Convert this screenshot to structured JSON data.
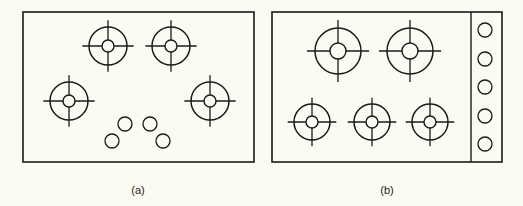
{
  "diagram": {
    "stroke_color": "#1a1a1a",
    "background": "#fbfaf3",
    "panels": [
      {
        "id": "a",
        "caption": "(a)",
        "frame": {
          "x": 23,
          "y": 12,
          "w": 231,
          "h": 150
        },
        "burners": [
          {
            "cx": 108,
            "cy": 46,
            "r": 19,
            "ri": 6
          },
          {
            "cx": 171,
            "cy": 46,
            "r": 19,
            "ri": 6
          },
          {
            "cx": 69,
            "cy": 101,
            "r": 19,
            "ri": 6
          },
          {
            "cx": 210,
            "cy": 101,
            "r": 19,
            "ri": 6
          }
        ],
        "knobs": [
          {
            "cx": 125,
            "cy": 124,
            "r": 7
          },
          {
            "cx": 150,
            "cy": 124,
            "r": 7
          },
          {
            "cx": 112,
            "cy": 141,
            "r": 7
          },
          {
            "cx": 163,
            "cy": 141,
            "r": 7
          }
        ]
      },
      {
        "id": "b",
        "caption": "(b)",
        "frame": {
          "x": 272,
          "y": 12,
          "w": 230,
          "h": 150
        },
        "divider_x": 471,
        "burners": [
          {
            "cx": 338,
            "cy": 51,
            "r": 23,
            "ri": 8
          },
          {
            "cx": 410,
            "cy": 51,
            "r": 23,
            "ri": 8
          },
          {
            "cx": 312,
            "cy": 122,
            "r": 18,
            "ri": 6
          },
          {
            "cx": 372,
            "cy": 122,
            "r": 18,
            "ri": 6
          },
          {
            "cx": 430,
            "cy": 122,
            "r": 18,
            "ri": 6
          }
        ],
        "knobs": [
          {
            "cx": 485,
            "cy": 30,
            "r": 7
          },
          {
            "cx": 485,
            "cy": 59,
            "r": 7
          },
          {
            "cx": 485,
            "cy": 87,
            "r": 7
          },
          {
            "cx": 485,
            "cy": 116,
            "r": 7
          },
          {
            "cx": 485,
            "cy": 144,
            "r": 7
          }
        ]
      }
    ]
  }
}
